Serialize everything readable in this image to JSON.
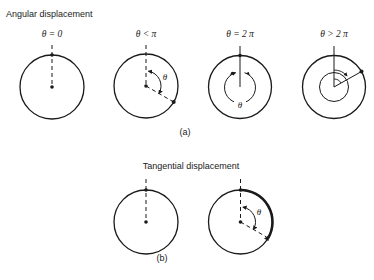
{
  "figure": {
    "part_a": {
      "title": "Angular displacement",
      "caption": "(a)",
      "panels": [
        {
          "label": "θ = 0",
          "arc_label": ""
        },
        {
          "label": "θ < π",
          "arc_label": "θ"
        },
        {
          "label": "θ = 2 π",
          "arc_label": "θ"
        },
        {
          "label": "θ > 2 π",
          "arc_label": ""
        }
      ]
    },
    "part_b": {
      "title": "Tangential displacement",
      "caption": "(b)",
      "panels": [
        {
          "label": "",
          "arc_label": ""
        },
        {
          "label": "",
          "arc_label": "θ"
        }
      ]
    },
    "colors": {
      "ink": "#1a1a1a",
      "background": "#ffffff"
    }
  }
}
